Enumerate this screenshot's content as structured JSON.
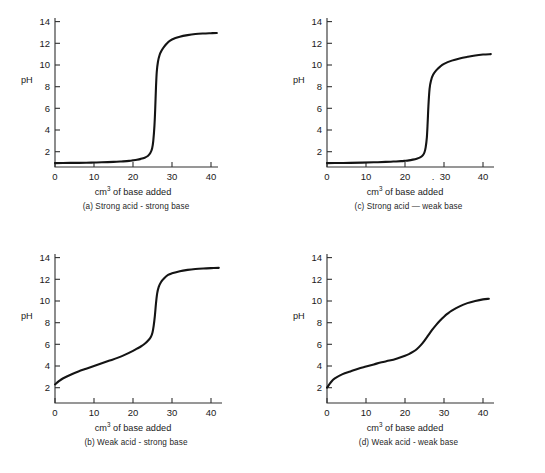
{
  "figure": {
    "background_color": "#ffffff",
    "curve_color": "#141414",
    "axis_color": "#303030",
    "panel_count": 4
  },
  "panels": [
    {
      "id": "a",
      "caption": "(a) Strong acid - strong base",
      "position": "top-left"
    },
    {
      "id": "c",
      "caption": "(c) Strong acid — weak base",
      "position": "top-right",
      "artifact_mark": "."
    },
    {
      "id": "b",
      "caption": "(b) Weak acid - strong base",
      "position": "bottom-left"
    },
    {
      "id": "d",
      "caption": "(d) Weak acid - weak base",
      "position": "bottom-right"
    }
  ],
  "axis": {
    "ylabel": "pH",
    "xlabel_main": "cm",
    "xlabel_sup": "3",
    "xlabel_rest": " of base added",
    "xticks": [
      "0",
      "10",
      "20",
      "30",
      "40"
    ],
    "xtick_values": [
      0,
      10,
      20,
      30,
      40
    ],
    "yticks": [
      "2",
      "4",
      "6",
      "8",
      "10",
      "12",
      "14"
    ],
    "ytick_values": [
      2,
      4,
      6,
      8,
      10,
      12,
      14
    ],
    "xlim": [
      0,
      43
    ],
    "ylim": [
      0,
      15
    ]
  },
  "chart_data": [
    {
      "type": "line",
      "id": "a",
      "title": "(a) Strong acid - strong base",
      "xlabel": "cm3 of base added",
      "ylabel": "pH",
      "xlim": [
        0,
        43
      ],
      "ylim": [
        0,
        15
      ],
      "grid": false,
      "legend": "none",
      "x": [
        0,
        2,
        5,
        8,
        10,
        12,
        15,
        17,
        19,
        20,
        21,
        22,
        23,
        23.8,
        24.4,
        24.9,
        25.2,
        25.5,
        25.7,
        25.9,
        26.1,
        26.4,
        26.8,
        27.3,
        28,
        29,
        30,
        32,
        34,
        36,
        38,
        40,
        41.5
      ],
      "y": [
        0.95,
        0.96,
        0.97,
        0.98,
        1.0,
        1.02,
        1.06,
        1.1,
        1.15,
        1.2,
        1.26,
        1.34,
        1.45,
        1.6,
        1.85,
        2.3,
        3.0,
        4.4,
        6.0,
        8.0,
        9.4,
        10.3,
        10.9,
        11.3,
        11.7,
        12.1,
        12.35,
        12.6,
        12.75,
        12.85,
        12.9,
        12.93,
        12.95
      ]
    },
    {
      "type": "line",
      "id": "c",
      "title": "(c) Strong acid — weak base",
      "xlabel": "cm3 of base added",
      "ylabel": "pH",
      "xlim": [
        0,
        43
      ],
      "ylim": [
        0,
        15
      ],
      "grid": false,
      "legend": "none",
      "x": [
        0,
        3,
        6,
        9,
        12,
        15,
        17,
        19,
        20,
        21,
        22,
        23,
        24,
        24.6,
        25.0,
        25.3,
        25.6,
        25.8,
        26.0,
        26.3,
        26.7,
        27.2,
        28,
        29,
        30,
        32,
        34,
        36,
        38,
        40,
        42
      ],
      "y": [
        0.95,
        0.96,
        0.97,
        0.99,
        1.02,
        1.06,
        1.09,
        1.13,
        1.16,
        1.2,
        1.27,
        1.36,
        1.5,
        1.68,
        1.95,
        2.4,
        3.3,
        4.6,
        6.2,
        7.8,
        8.6,
        9.1,
        9.5,
        9.85,
        10.1,
        10.4,
        10.6,
        10.75,
        10.88,
        10.96,
        11.0
      ]
    },
    {
      "type": "line",
      "id": "b",
      "title": "(b) Weak acid - strong base",
      "xlabel": "cm3 of base added",
      "ylabel": "pH",
      "xlim": [
        0,
        43
      ],
      "ylim": [
        0,
        15
      ],
      "grid": false,
      "legend": "none",
      "x": [
        0,
        1,
        2,
        4,
        6,
        8,
        10,
        12,
        14,
        16,
        18,
        20,
        21,
        22,
        23,
        24,
        24.6,
        25.0,
        25.3,
        25.6,
        25.9,
        26.2,
        26.6,
        27.2,
        28,
        29,
        30,
        32,
        34,
        36,
        38,
        40,
        42
      ],
      "y": [
        2.3,
        2.6,
        2.85,
        3.2,
        3.5,
        3.75,
        4.0,
        4.25,
        4.5,
        4.75,
        5.05,
        5.4,
        5.6,
        5.8,
        6.05,
        6.4,
        6.7,
        7.1,
        7.7,
        8.6,
        9.8,
        10.7,
        11.3,
        11.75,
        12.1,
        12.4,
        12.55,
        12.75,
        12.87,
        12.95,
        13.0,
        13.03,
        13.05
      ]
    },
    {
      "type": "line",
      "id": "d",
      "title": "(d) Weak acid - weak base",
      "xlabel": "cm3 of base added",
      "ylabel": "pH",
      "xlim": [
        0,
        43
      ],
      "ylim": [
        0,
        15
      ],
      "grid": false,
      "legend": "none",
      "x": [
        0,
        1,
        2,
        4,
        6,
        8,
        10,
        12,
        14,
        16,
        18,
        20,
        21,
        22,
        23,
        24,
        25,
        26,
        27,
        28,
        29,
        30,
        31,
        32,
        34,
        36,
        38,
        40,
        41.5
      ],
      "y": [
        2.0,
        2.5,
        2.85,
        3.25,
        3.5,
        3.75,
        3.95,
        4.15,
        4.35,
        4.5,
        4.7,
        4.95,
        5.1,
        5.3,
        5.55,
        5.9,
        6.35,
        6.85,
        7.35,
        7.8,
        8.2,
        8.55,
        8.85,
        9.1,
        9.5,
        9.8,
        10.0,
        10.15,
        10.2
      ]
    }
  ]
}
